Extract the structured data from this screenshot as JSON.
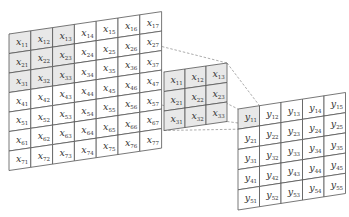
{
  "diagram": {
    "input": {
      "symbol": "x",
      "rows": 7,
      "cols": 7,
      "labels": [
        [
          "x11",
          "x12",
          "x13",
          "x14",
          "x15",
          "x16",
          "x17"
        ],
        [
          "x21",
          "x22",
          "x23",
          "x24",
          "x25",
          "x26",
          "x27"
        ],
        [
          "x31",
          "x32",
          "x33",
          "x34",
          "x35",
          "x36",
          "x37"
        ],
        [
          "x41",
          "x42",
          "x43",
          "x44",
          "x45",
          "x46",
          "x47"
        ],
        [
          "x51",
          "x52",
          "x53",
          "x54",
          "x55",
          "x56",
          "x57"
        ],
        [
          "x61",
          "x62",
          "x63",
          "x64",
          "x65",
          "x66",
          "x67"
        ],
        [
          "x71",
          "x72",
          "x73",
          "x74",
          "x75",
          "x76",
          "x77"
        ]
      ],
      "highlighted": [
        "x11",
        "x12",
        "x13",
        "x21",
        "x22",
        "x23",
        "x31",
        "x32",
        "x33"
      ]
    },
    "kernel": {
      "symbol": "x",
      "rows": 3,
      "cols": 3,
      "labels": [
        [
          "x11",
          "x12",
          "x13"
        ],
        [
          "x21",
          "x22",
          "x23"
        ],
        [
          "x31",
          "x32",
          "x33"
        ]
      ]
    },
    "output": {
      "symbol": "y",
      "rows": 5,
      "cols": 5,
      "labels": [
        [
          "y11",
          "y12",
          "y13",
          "y14",
          "y15"
        ],
        [
          "y21",
          "y22",
          "y23",
          "y24",
          "y25"
        ],
        [
          "y31",
          "y32",
          "y33",
          "y34",
          "y35"
        ],
        [
          "y41",
          "y42",
          "y43",
          "y44",
          "y45"
        ],
        [
          "y51",
          "y52",
          "y53",
          "y54",
          "y55"
        ]
      ],
      "highlighted": [
        "y11"
      ]
    },
    "colors": {
      "grid_line": "#555555",
      "highlight_fill": "#e8e8e8",
      "dashed_line": "#888888"
    }
  }
}
